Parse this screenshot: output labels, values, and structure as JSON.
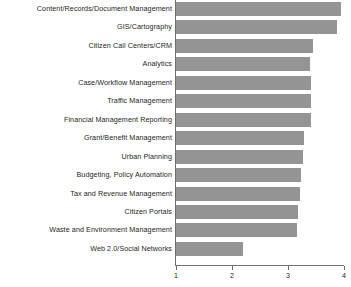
{
  "chart_data": {
    "type": "bar",
    "orientation": "horizontal",
    "title": "",
    "subtitle": "",
    "xlabel": "",
    "ylabel": "",
    "xlim": [
      1,
      4
    ],
    "xticks": [
      1,
      2,
      3,
      4
    ],
    "xtick_labels": [
      "1",
      "2",
      "3",
      "4"
    ],
    "grid": false,
    "legend": null,
    "bar_color": "#949494",
    "axis_color": "#6d6e70",
    "text_color": "#231f20",
    "categories": [
      "Content/Records/Document Management",
      "GIS/Cartography",
      "Citizen Call Centers/CRM",
      "Analytics",
      "Case/Workflow Management",
      "Traffic Management",
      "Financial Management Reporting",
      "Grant/Benefit Management",
      "Urban Planning",
      "Budgeting, Policy Automation",
      "Tax and Revenue Management",
      "Citizen Portals",
      "Waste and Environment Management",
      "Web 2.0/Social Networks"
    ],
    "values": [
      3.95,
      3.87,
      3.44,
      3.39,
      3.41,
      3.41,
      3.41,
      3.28,
      3.26,
      3.23,
      3.21,
      3.17,
      3.16,
      2.2
    ]
  }
}
